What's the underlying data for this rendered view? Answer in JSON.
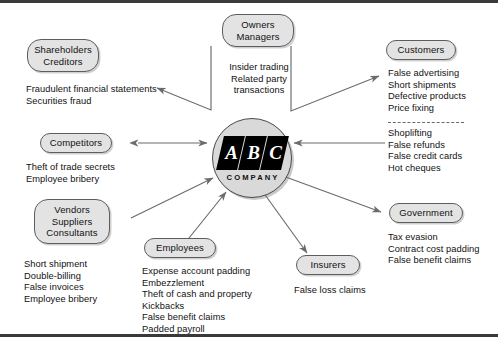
{
  "figure": {
    "center": {
      "logo_letters": [
        "A",
        "B",
        "C"
      ],
      "wordmark": "COMPANY"
    },
    "nodes": [
      {
        "id": "owners-managers",
        "lines": [
          "Owners",
          "Managers"
        ],
        "items": [
          "Insider trading",
          "Related party",
          "transactions"
        ]
      },
      {
        "id": "shareholders-creditors",
        "lines": [
          "Shareholders",
          "Creditors"
        ],
        "items": [
          "Fraudulent financial statements",
          "Securities fraud"
        ]
      },
      {
        "id": "customers",
        "lines": [
          "Customers"
        ],
        "items": [
          "False advertising",
          "Short shipments",
          "Defective products",
          "Price fixing"
        ],
        "items_below_divider": [
          "Shoplifting",
          "False refunds",
          "False credit cards",
          "Hot cheques"
        ]
      },
      {
        "id": "competitors",
        "lines": [
          "Competitors"
        ],
        "items": [
          "Theft of trade secrets",
          "Employee bribery"
        ]
      },
      {
        "id": "vendors-suppliers-consultants",
        "lines": [
          "Vendors",
          "Suppliers",
          "Consultants"
        ],
        "items": [
          "Short shipment",
          "Double-billing",
          "False invoices",
          "Employee bribery"
        ]
      },
      {
        "id": "employees",
        "lines": [
          "Employees"
        ],
        "items": [
          "Expense account padding",
          "Embezzlement",
          "Theft of cash and property",
          "Kickbacks",
          "False benefit claims",
          "Padded payroll"
        ]
      },
      {
        "id": "insurers",
        "lines": [
          "Insurers"
        ],
        "items": [
          "False loss claims"
        ]
      },
      {
        "id": "government",
        "lines": [
          "Government"
        ],
        "items": [
          "Tax evasion",
          "Contract cost padding",
          "False benefit claims"
        ]
      }
    ],
    "colors": {
      "node_fill": "#e3e3e3",
      "node_stroke": "#5d5d5d",
      "logo_fill": "#d9d9d9",
      "logo_slab": "#000000",
      "line": "#6b6b6b",
      "rule": "#3a3a3a",
      "text": "#111111"
    }
  }
}
